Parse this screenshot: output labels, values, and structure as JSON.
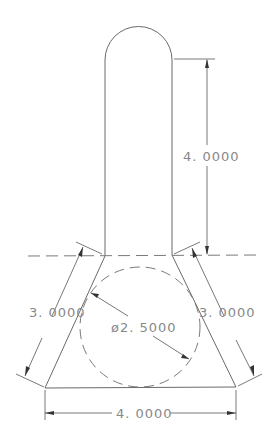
{
  "drawing": {
    "type": "technical-drawing",
    "stroke_color": "#6a6a6a",
    "background": "#ffffff",
    "dimensions": {
      "stem_height": "4. 0000",
      "left_side": "3. 0000",
      "right_side": "3. 0000",
      "circle_diameter": "ø2. 5000",
      "base_width": "4. 0000"
    }
  }
}
